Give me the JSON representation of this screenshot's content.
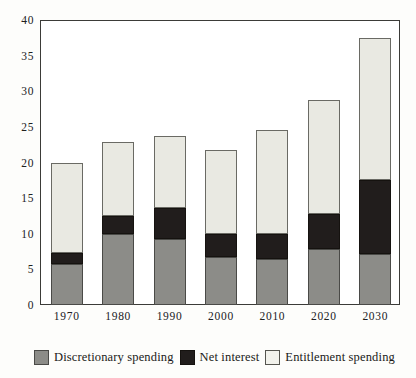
{
  "chart_data": {
    "type": "bar",
    "stacked": true,
    "title": "",
    "subtitle": "",
    "xlabel": "",
    "ylabel": "",
    "categories": [
      "1970",
      "1980",
      "1990",
      "2000",
      "2010",
      "2020",
      "2030"
    ],
    "series": [
      {
        "name": "Discretionary spending",
        "color": "#8c8c88",
        "values": [
          5.8,
          9.9,
          9.3,
          6.7,
          6.5,
          7.9,
          7.2
        ]
      },
      {
        "name": "Net interest",
        "color": "#211d1c",
        "values": [
          1.5,
          2.6,
          4.3,
          3.2,
          3.5,
          4.9,
          10.3
        ]
      },
      {
        "name": "Entitlement spending",
        "color": "#e9e9e2",
        "values": [
          12.6,
          10.4,
          10.1,
          11.9,
          14.6,
          16.0,
          20.0
        ]
      }
    ],
    "totals": [
      19.9,
      22.9,
      23.7,
      21.8,
      24.6,
      28.8,
      37.5
    ],
    "ylim": [
      0,
      40
    ],
    "yticks": [
      0,
      5,
      10,
      15,
      20,
      25,
      30,
      35,
      40
    ],
    "ytick_labels": [
      "0",
      "5",
      "10",
      "15",
      "20",
      "25",
      "30",
      "35",
      "40"
    ],
    "grid": false,
    "legend_position": "bottom"
  },
  "legend": {
    "items": [
      {
        "label": "Discretionary spending",
        "swatch": "discretionary"
      },
      {
        "label": "Net interest",
        "swatch": "interest"
      },
      {
        "label": "Entitlement spending",
        "swatch": "entitlement"
      }
    ]
  }
}
